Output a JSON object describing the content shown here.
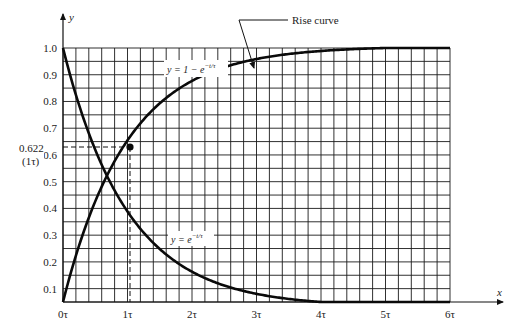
{
  "chart_data": {
    "type": "line",
    "title": "",
    "xlabel": "x",
    "ylabel": "y",
    "xlim": [
      0,
      6
    ],
    "ylim": [
      0.05,
      1.0
    ],
    "grid": true,
    "grid_minor_x_step": 0.2,
    "grid_minor_y_step": 0.05,
    "x_ticks": [
      0,
      1,
      2,
      3,
      4,
      5,
      6
    ],
    "x_tick_labels": [
      "0τ",
      "1τ",
      "2τ",
      "3τ",
      "4τ",
      "5τ",
      "6τ"
    ],
    "y_ticks": [
      0.1,
      0.2,
      0.3,
      0.4,
      0.5,
      0.6,
      0.7,
      0.8,
      0.9,
      1.0
    ],
    "y_tick_labels": [
      "0.1",
      "0.2",
      "0.3",
      "0.4",
      "0.5",
      "0.6",
      "0.7",
      "0.8",
      "0.9",
      "1.0"
    ],
    "series": [
      {
        "name": "Rise curve",
        "label": "y = 1 − e^(−t/τ)",
        "x": [
          0,
          0.25,
          0.5,
          0.75,
          1,
          1.5,
          2,
          2.5,
          3,
          3.5,
          4,
          4.5,
          5,
          5.5,
          6
        ],
        "values": [
          0.05,
          0.27,
          0.43,
          0.55,
          0.63,
          0.76,
          0.84,
          0.9,
          0.94,
          0.97,
          0.985,
          0.995,
          1.0,
          1.0,
          1.0
        ]
      },
      {
        "name": "Decay curve",
        "label": "y = e^(−t/τ)",
        "x": [
          0,
          0.25,
          0.5,
          0.75,
          1,
          1.5,
          2,
          2.5,
          3,
          3.5,
          4,
          4.5,
          5,
          5.5,
          6
        ],
        "values": [
          1.0,
          0.78,
          0.61,
          0.48,
          0.37,
          0.25,
          0.18,
          0.13,
          0.09,
          0.065,
          0.05,
          0.05,
          0.05,
          0.05,
          0.05
        ]
      }
    ],
    "annotations": [
      {
        "text": "Rise curve",
        "type": "callout",
        "points_to_series": "Rise curve"
      },
      {
        "text": "y = 1 − e",
        "superscript": "−t/τ",
        "type": "equation_label",
        "series": "Rise curve"
      },
      {
        "text": "y = e",
        "superscript": "−t/τ",
        "type": "equation_label",
        "series": "Decay curve"
      },
      {
        "text": "0.622",
        "subtext": "(1τ)",
        "type": "marker",
        "x": 1,
        "y": 0.622,
        "dashed_guides": true
      }
    ],
    "legend": "none"
  },
  "labels": {
    "x_axis": "x",
    "y_axis": "y",
    "rise_callout": "Rise curve",
    "rise_eq_main": "y = 1 − e",
    "rise_eq_sup": "−t/τ",
    "decay_eq_main": "y = e",
    "decay_eq_sup": "−t/τ",
    "marker_value": "0.622",
    "marker_sub": "(1τ)"
  },
  "colors": {
    "curve": "#0a0a0a",
    "grid": "#1a1a1a",
    "text": "#222222",
    "background": "#ffffff"
  }
}
